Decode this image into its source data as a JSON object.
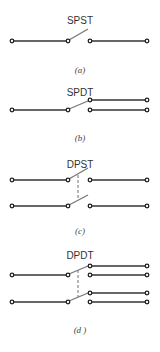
{
  "figure": {
    "panels": [
      {
        "id": "a",
        "title": "SPST",
        "caption": "(a)"
      },
      {
        "id": "b",
        "title": "SPDT",
        "caption": "(b)"
      },
      {
        "id": "c",
        "title": "DPST",
        "caption": "(c)"
      },
      {
        "id": "d",
        "title": "DPDT",
        "caption": "(d )"
      }
    ]
  }
}
